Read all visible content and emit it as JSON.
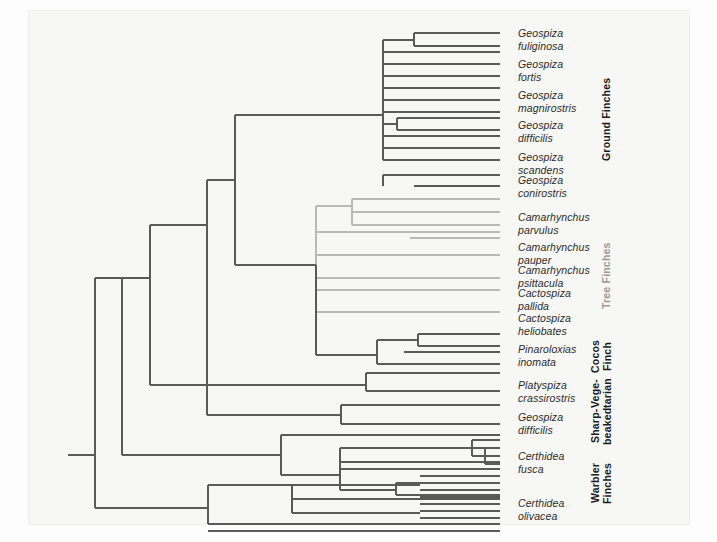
{
  "figure": {
    "background_color": "#f7f7f6",
    "branch_color": "#5a5a5a",
    "branch_color_light": "#b9b9b9",
    "label_color": "#2b2b2b"
  },
  "species": [
    {
      "id": "geospiza-fuliginosa",
      "line1": "Geospiza",
      "line2": "fuliginosa",
      "x": 518,
      "y": 27,
      "group": "ground"
    },
    {
      "id": "geospiza-fortis",
      "line1": "Geospiza",
      "line2": "fortis",
      "x": 518,
      "y": 58,
      "group": "ground"
    },
    {
      "id": "geospiza-magnirostris",
      "line1": "Geospiza",
      "line2": "magnirostris",
      "x": 518,
      "y": 89,
      "group": "ground"
    },
    {
      "id": "geospiza-difficilis-g",
      "line1": "Geospiza",
      "line2": "difficilis",
      "x": 518,
      "y": 119,
      "group": "ground"
    },
    {
      "id": "geospiza-scandens",
      "line1": "Geospiza",
      "line2": "scandens",
      "x": 518,
      "y": 151,
      "group": "ground"
    },
    {
      "id": "geospiza-conirostris",
      "line1": "Geospiza",
      "line2": "conirostris",
      "x": 518,
      "y": 174,
      "group": "ground"
    },
    {
      "id": "camarhynchus-parvulus",
      "line1": "Camarhynchus",
      "line2": "parvulus",
      "x": 518,
      "y": 211,
      "group": "tree"
    },
    {
      "id": "camarhynchus-pauper",
      "line1": "Camarhynchus",
      "line2": "pauper",
      "x": 518,
      "y": 241,
      "group": "tree"
    },
    {
      "id": "camarhynchus-psittacula",
      "line1": "Camarhynchus",
      "line2": "psittacula",
      "x": 518,
      "y": 264,
      "group": "tree"
    },
    {
      "id": "cactospiza-pallida",
      "line1": "Cactospiza",
      "line2": "pallida",
      "x": 518,
      "y": 287,
      "group": "tree"
    },
    {
      "id": "cactospiza-heliobates",
      "line1": "Cactospiza",
      "line2": "heliobates",
      "x": 518,
      "y": 312,
      "group": "tree"
    },
    {
      "id": "pinaroloxias-inomata",
      "line1": "Pinaroloxias",
      "line2": "inomata",
      "x": 518,
      "y": 343,
      "group": "cocos"
    },
    {
      "id": "platyspiza-crassirostris",
      "line1": "Platyspiza",
      "line2": "crassirostris",
      "x": 518,
      "y": 379,
      "group": "vegetarian"
    },
    {
      "id": "geospiza-difficilis-s",
      "line1": "Geospiza",
      "line2": "difficilis",
      "x": 518,
      "y": 411,
      "group": "sharp-beaked"
    },
    {
      "id": "certhidea-fusca",
      "line1": "Certhidea",
      "line2": "fusca",
      "x": 518,
      "y": 450,
      "group": "warbler"
    },
    {
      "id": "certhidea-olivacea",
      "line1": "Certhidea",
      "line2": "olivacea",
      "x": 518,
      "y": 497,
      "group": "warbler"
    }
  ],
  "groups": [
    {
      "id": "ground-finches",
      "text": "Ground Finches",
      "x": 600,
      "y": 72,
      "height": 95,
      "light": false
    },
    {
      "id": "tree-finches",
      "text": "Tree Finches",
      "x": 600,
      "y": 236,
      "height": 80,
      "light": true
    },
    {
      "id": "cocos-finch",
      "text": "Cocos\nFinch",
      "x": 589,
      "y": 334,
      "height": 45,
      "light": false
    },
    {
      "id": "vegetarian",
      "text": "Vege-\ntarian",
      "x": 589,
      "y": 371,
      "height": 45,
      "light": false
    },
    {
      "id": "sharp-beaked",
      "text": "Sharp-\nbeaked",
      "x": 589,
      "y": 402,
      "height": 48,
      "light": false
    },
    {
      "id": "warbler-finches",
      "text": "Warbler\nFinches",
      "x": 589,
      "y": 453,
      "height": 60,
      "light": false
    }
  ],
  "tree_structure": {
    "root_x": 95,
    "root_y": 455,
    "root_stub_x": 68,
    "dark_paths": "M68,455 H95 M95,278 V508 M95,278 H122 M122,278 V455 M122,455 H281 M122,278 H150 M150,225 V385 M150,385 H366 M150,225 H207 M207,180 V415 M207,415 H341 M207,180 H235 M235,115 V265 M235,115 H383 M235,265 H316 M95,508 H208 M208,485 V524 M208,485 H292 M208,524 H420 M292,485 V513 M292,485 H420 M292,513 H420 M383,40 V160 M383,40 H414 M383,52 H500 M383,64 H500 M383,76 H500 M383,88 H500 M383,100 H500 M383,112 H500 M383,124 H397 M383,136 H500 M383,148 H500 M383,160 H500 M414,33 V46 M414,33 H500 M414,46 H500 M397,118 V130 M397,118 H500 M397,130 H500 M383,175 V186 M383,175 H414 M414,175 H500 M414,186 H500 M341,405 V424 M341,405 H420 M341,424 H500 M420,405 H500 M366,373 V391 M366,373 H382 M366,391 H500 M382,373 H500 M316,265 V355 M316,355 H377 M377,340 V364 M377,340 H404 M377,364 H500 M404,340 H418 M404,352 H500 M418,334 V346 M418,334 H500 M418,346 H500 M281,435 V475 M281,435 H500 M281,475 H340 M340,448 V490 M340,448 H472 M340,490 H396 M472,440 V456 M472,440 H500 M472,456 H485 M485,448 V464 M485,448 H500 M485,464 H500 M396,483 V495 M396,483 H420 M396,495 H500 M420,476 H500 M420,483 H500 M420,490 H500 M472,448 H500 M485,456 H500 M340,462 H500 M340,469 H500 M420,497 H500 M420,504 H500 M420,511 H500 M420,518 H500 M420,524 H500 M292,499 H500 M208,531 H500",
    "light_paths": "M316,206 V312 M316,206 H352 M316,232 H500 M316,255 H500 M316,278 H500 M316,312 H500 M352,199 V225 M352,199 H410 M352,225 H410 M410,199 H500 M410,212 H500 M410,225 H500 M410,238 H500 M352,212 H500 M316,290 H500"
  }
}
